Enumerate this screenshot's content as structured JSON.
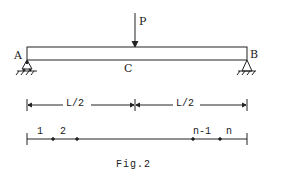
{
  "figure": {
    "caption": "Fig.2",
    "beam": {
      "left_support_label": "A",
      "right_support_label": "B",
      "midpoint_label": "C",
      "load_label": "P"
    },
    "dimensions": {
      "left_span": "L/2",
      "right_span": "L/2"
    },
    "discretization": {
      "node_labels": [
        "1",
        "2",
        "n-1",
        "n"
      ]
    },
    "colors": {
      "line": "#222222",
      "background": "#ffffff"
    }
  }
}
